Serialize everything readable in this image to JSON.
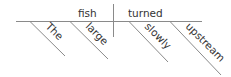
{
  "diagram": {
    "type": "sentence-diagram",
    "sentence": "The large fish turned slowly upstream",
    "colors": {
      "line": "#888888",
      "text": "#333333",
      "background": "#ffffff"
    },
    "subject": "fish",
    "verb": "turned",
    "subject_modifiers": [
      "The",
      "large"
    ],
    "verb_modifiers": [
      "slowly",
      "upstream"
    ]
  }
}
